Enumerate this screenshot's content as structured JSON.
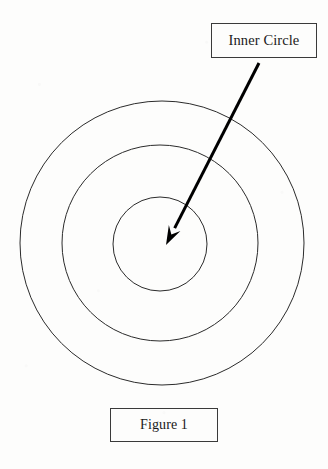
{
  "figure": {
    "title": "Figure 1",
    "background_color": "#fdfdfc",
    "stroke_color": "#2b2b2b",
    "annotation_color": "#000000",
    "callout": {
      "label": "Inner Circle",
      "box": {
        "x": 211,
        "y": 23,
        "width": 106,
        "height": 35
      },
      "border_color": "#3a3a3a"
    },
    "caption": {
      "label": "Figure 1",
      "box": {
        "x": 110,
        "y": 408,
        "width": 108,
        "height": 34
      },
      "border_color": "#3a3a3a"
    },
    "arrow": {
      "name": "callout-arrow",
      "from": {
        "x": 259,
        "y": 63
      },
      "to": {
        "x": 166,
        "y": 245
      },
      "color": "#000000",
      "line_width": 3,
      "head_length": 19,
      "head_width": 13
    },
    "circles": [
      {
        "name": "outer-circle",
        "cx": 162,
        "cy": 243,
        "r": 142,
        "stroke": "#2b2b2b",
        "stroke_width": 1,
        "fill": "none"
      },
      {
        "name": "middle-circle",
        "cx": 160,
        "cy": 243,
        "r": 98,
        "stroke": "#2b2b2b",
        "stroke_width": 1,
        "fill": "none"
      },
      {
        "name": "inner-circle",
        "cx": 160,
        "cy": 244,
        "r": 47,
        "stroke": "#2b2b2b",
        "stroke_width": 1,
        "fill": "none"
      }
    ]
  },
  "chart_data": {
    "type": "diagram",
    "title": "Figure 1",
    "shapes": [
      {
        "label": "outer circle",
        "radius": 142,
        "center": [
          162,
          243
        ]
      },
      {
        "label": "middle circle",
        "radius": 98,
        "center": [
          160,
          243
        ]
      },
      {
        "label": "inner circle",
        "radius": 47,
        "center": [
          160,
          244
        ]
      }
    ],
    "annotations": [
      {
        "text": "Inner Circle",
        "points_to": "inner circle",
        "tip": [
          166,
          245
        ],
        "tail": [
          259,
          63
        ]
      },
      {
        "text": "Figure 1",
        "role": "caption"
      }
    ],
    "legend": null,
    "grid": false
  }
}
